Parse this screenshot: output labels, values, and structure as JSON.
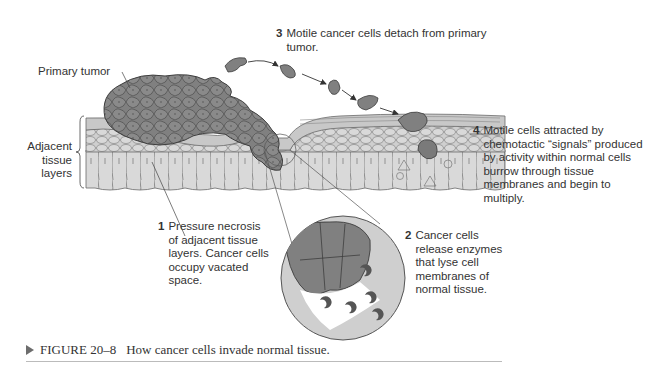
{
  "labels": {
    "primary_tumor": "Primary tumor",
    "adjacent_tissue": "Adjacent\ntissue\nlayers"
  },
  "steps": [
    {
      "number": "1",
      "text": "Pressure necrosis\nof adjacent tissue\nlayers. Cancer cells\noccupy vacated\nspace."
    },
    {
      "number": "2",
      "text": "Cancer cells\nrelease enzymes\nthat lyse cell\nmembranes of\nnormal tissue."
    },
    {
      "number": "3",
      "text": "Motile cancer cells detach from primary\ntumor."
    },
    {
      "number": "4",
      "text": "Motile cells attracted by\nchemotactic “signals” produced\nby activity within normal cells\nburrow through tissue\nmembranes and begin to\nmultiply."
    }
  ],
  "caption": {
    "figure": "FIGURE 20–8",
    "text": "How cancer cells invade normal tissue."
  },
  "colors": {
    "tumor": "#7f7f7f",
    "tissue_light": "#d6d6d6",
    "tissue_mid": "#c4c4c4",
    "outline": "#5a5a5a",
    "enzyme": "#555555"
  }
}
